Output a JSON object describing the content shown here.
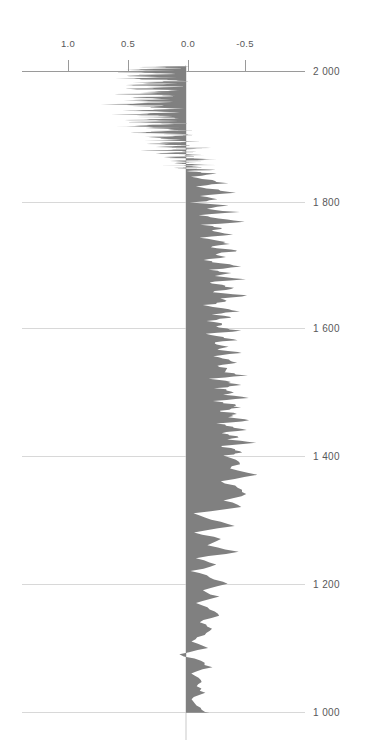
{
  "title": "",
  "chart_data": {
    "type": "area",
    "orientation": "vertical",
    "title": "",
    "subtitle": "",
    "xlabel": "",
    "ylabel": "",
    "xlim": [
      1.15,
      -0.72
    ],
    "ylim": [
      1000,
      2010
    ],
    "x_axis_position": "top",
    "x_axis_reversed": true,
    "y_axis_position": "right",
    "y_axis_reversed": true,
    "grid": "horizontal",
    "legend": "none",
    "fill_color": "#808080",
    "zero_baseline": 0.0,
    "xticks": [
      1.0,
      0.5,
      0.0,
      -0.5
    ],
    "xtick_labels": [
      "1.0",
      "0.5",
      "0.0",
      "-0.5"
    ],
    "yticks": [
      2000,
      1800,
      1600,
      1400,
      1200,
      1000
    ],
    "ytick_labels": [
      "2 000",
      "1 800",
      "1 600",
      "1 400",
      "1 200",
      "1 000"
    ],
    "series": [
      {
        "name": "anomaly",
        "x_is_value": true,
        "y": [
          2008,
          2006,
          2004,
          2002,
          2000,
          1998,
          1996,
          1994,
          1992,
          1990,
          1988,
          1986,
          1984,
          1982,
          1980,
          1978,
          1976,
          1974,
          1972,
          1970,
          1968,
          1966,
          1964,
          1962,
          1960,
          1958,
          1956,
          1954,
          1952,
          1950,
          1948,
          1946,
          1944,
          1942,
          1940,
          1938,
          1936,
          1934,
          1932,
          1930,
          1928,
          1926,
          1924,
          1922,
          1920,
          1918,
          1916,
          1914,
          1912,
          1910,
          1908,
          1906,
          1904,
          1902,
          1900,
          1898,
          1896,
          1894,
          1892,
          1890,
          1888,
          1886,
          1884,
          1882,
          1880,
          1878,
          1876,
          1874,
          1872,
          1870,
          1868,
          1866,
          1864,
          1862,
          1860,
          1858,
          1856,
          1854,
          1852,
          1850,
          1848,
          1846,
          1844,
          1842,
          1840,
          1835,
          1830,
          1825,
          1820,
          1815,
          1810,
          1805,
          1800,
          1795,
          1790,
          1785,
          1780,
          1775,
          1770,
          1765,
          1760,
          1755,
          1750,
          1745,
          1740,
          1735,
          1730,
          1725,
          1720,
          1715,
          1710,
          1705,
          1700,
          1695,
          1690,
          1685,
          1680,
          1675,
          1670,
          1665,
          1660,
          1655,
          1650,
          1645,
          1640,
          1635,
          1630,
          1625,
          1620,
          1615,
          1610,
          1605,
          1600,
          1595,
          1590,
          1585,
          1580,
          1575,
          1570,
          1565,
          1560,
          1555,
          1550,
          1545,
          1540,
          1535,
          1530,
          1525,
          1520,
          1515,
          1510,
          1505,
          1500,
          1495,
          1490,
          1485,
          1480,
          1475,
          1470,
          1465,
          1460,
          1455,
          1450,
          1445,
          1440,
          1435,
          1430,
          1425,
          1420,
          1415,
          1410,
          1405,
          1400,
          1390,
          1380,
          1370,
          1360,
          1350,
          1340,
          1330,
          1320,
          1310,
          1300,
          1290,
          1280,
          1270,
          1260,
          1250,
          1240,
          1230,
          1220,
          1210,
          1200,
          1190,
          1180,
          1170,
          1160,
          1150,
          1140,
          1130,
          1120,
          1110,
          1100,
          1090,
          1080,
          1070,
          1060,
          1050,
          1040,
          1030,
          1020,
          1010,
          1000
        ],
        "values": [
          0.04,
          0.32,
          0.1,
          0.42,
          0.18,
          0.55,
          0.08,
          0.3,
          0.46,
          0.14,
          0.6,
          0.22,
          0.05,
          0.38,
          0.16,
          0.5,
          0.12,
          0.28,
          0.44,
          0.09,
          0.34,
          0.2,
          0.52,
          0.07,
          0.26,
          0.4,
          0.15,
          0.48,
          0.11,
          0.3,
          0.58,
          0.19,
          0.36,
          0.06,
          0.24,
          0.42,
          0.13,
          0.29,
          0.5,
          0.17,
          0.33,
          0.08,
          0.45,
          0.21,
          0.37,
          0.1,
          0.27,
          0.54,
          0.15,
          0.31,
          0.05,
          0.23,
          0.41,
          0.12,
          -0.02,
          0.18,
          0.35,
          0.07,
          0.26,
          -0.05,
          0.14,
          0.3,
          0.02,
          0.22,
          -0.08,
          0.11,
          0.28,
          -0.03,
          0.19,
          0.06,
          -0.12,
          0.15,
          0.03,
          -0.18,
          0.09,
          -0.06,
          0.12,
          -0.22,
          0.05,
          -0.14,
          0.08,
          -0.26,
          0.02,
          -0.1,
          -0.28,
          -0.05,
          -0.2,
          -0.34,
          -0.08,
          -0.24,
          -0.4,
          -0.12,
          -0.3,
          -0.06,
          -0.36,
          -0.16,
          -0.44,
          -0.1,
          -0.26,
          -0.5,
          -0.14,
          -0.32,
          -0.22,
          -0.42,
          -0.12,
          -0.28,
          -0.38,
          -0.18,
          -0.46,
          -0.24,
          -0.34,
          -0.15,
          -0.3,
          -0.44,
          -0.2,
          -0.36,
          -0.26,
          -0.48,
          -0.18,
          -0.32,
          -0.4,
          -0.22,
          -0.52,
          -0.28,
          -0.36,
          -0.16,
          -0.3,
          -0.44,
          -0.24,
          -0.38,
          -0.2,
          -0.34,
          -0.26,
          -0.46,
          -0.18,
          -0.32,
          -0.4,
          -0.22,
          -0.36,
          -0.28,
          -0.5,
          -0.2,
          -0.34,
          -0.42,
          -0.24,
          -0.38,
          -0.3,
          -0.52,
          -0.22,
          -0.36,
          -0.44,
          -0.26,
          -0.4,
          -0.32,
          -0.54,
          -0.24,
          -0.38,
          -0.46,
          -0.28,
          -0.42,
          -0.34,
          -0.56,
          -0.26,
          -0.4,
          -0.48,
          -0.3,
          -0.44,
          -0.36,
          -0.58,
          -0.28,
          -0.42,
          -0.5,
          -0.32,
          -0.46,
          -0.38,
          -0.6,
          -0.3,
          -0.44,
          -0.52,
          -0.34,
          -0.48,
          -0.05,
          -0.22,
          -0.4,
          -0.08,
          -0.3,
          -0.18,
          -0.44,
          -0.1,
          -0.26,
          -0.06,
          -0.2,
          -0.34,
          -0.12,
          -0.28,
          -0.08,
          -0.22,
          -0.3,
          -0.1,
          -0.24,
          -0.14,
          -0.04,
          -0.18,
          0.06,
          -0.12,
          -0.2,
          -0.02,
          -0.14,
          -0.08,
          -0.16,
          -0.04,
          -0.1,
          -0.18,
          -0.06,
          -0.12,
          -0.02,
          -0.14,
          -0.08,
          -0.16,
          -0.1,
          -0.18
        ]
      }
    ]
  },
  "axes": {
    "x_ticks": [
      {
        "label": "1.0",
        "value": 1.0,
        "px": 68
      },
      {
        "label": "0.5",
        "value": 0.5,
        "px": 128
      },
      {
        "label": "0.0",
        "value": 0.0,
        "px": 188
      },
      {
        "label": "-0.5",
        "value": -0.5,
        "px": 245
      }
    ],
    "y_ticks": [
      {
        "label": "2 000",
        "value": 2000,
        "px": 71
      },
      {
        "label": "1 800",
        "value": 1800,
        "px": 202
      },
      {
        "label": "1 600",
        "value": 1600,
        "px": 328
      },
      {
        "label": "1 400",
        "value": 1400,
        "px": 456
      },
      {
        "label": "1 200",
        "value": 1200,
        "px": 584
      },
      {
        "label": "1 000",
        "value": 1000,
        "px": 712
      }
    ]
  },
  "colors": {
    "fill": "#808080",
    "gridline": "#d8d8d8",
    "axis": "#9a9a9a",
    "tick_label": "#58585a",
    "background": "#ffffff"
  }
}
